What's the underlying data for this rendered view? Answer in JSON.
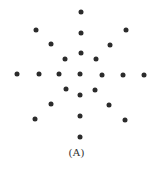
{
  "figure": {
    "caption": "(A)",
    "dot_color": "#2b2b2b",
    "dots": [
      {
        "x": 80.7,
        "y": 11.7
      },
      {
        "x": 35.7,
        "y": 29.7
      },
      {
        "x": 80.7,
        "y": 33.0
      },
      {
        "x": 125.7,
        "y": 30.3
      },
      {
        "x": 50.7,
        "y": 44.3
      },
      {
        "x": 110.0,
        "y": 45.3
      },
      {
        "x": 80.7,
        "y": 53.3
      },
      {
        "x": 65.0,
        "y": 59.3
      },
      {
        "x": 95.7,
        "y": 59.3
      },
      {
        "x": 17.3,
        "y": 74.0
      },
      {
        "x": 38.7,
        "y": 74.0
      },
      {
        "x": 59.0,
        "y": 74.0
      },
      {
        "x": 80.3,
        "y": 74.0
      },
      {
        "x": 101.7,
        "y": 74.7
      },
      {
        "x": 122.7,
        "y": 75.0
      },
      {
        "x": 143.7,
        "y": 75.3
      },
      {
        "x": 65.7,
        "y": 89.0
      },
      {
        "x": 95.0,
        "y": 89.7
      },
      {
        "x": 80.3,
        "y": 95.3
      },
      {
        "x": 50.7,
        "y": 104.0
      },
      {
        "x": 109.3,
        "y": 104.7
      },
      {
        "x": 80.3,
        "y": 115.7
      },
      {
        "x": 35.3,
        "y": 118.7
      },
      {
        "x": 124.7,
        "y": 120.3
      },
      {
        "x": 80.3,
        "y": 137.3
      }
    ]
  }
}
